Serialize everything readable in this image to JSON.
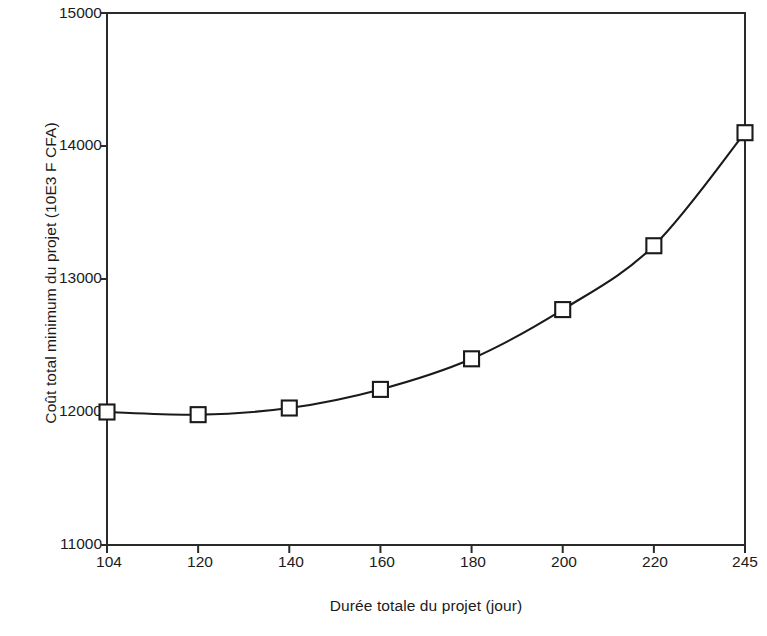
{
  "chart_data": {
    "type": "line",
    "title": "",
    "subtitle": "",
    "xlabel": "Durée totale du projet (jour)",
    "ylabel": "Coût total minimum du projet (10E3 F CFA)",
    "categories": [
      "104",
      "120",
      "140",
      "160",
      "180",
      "200",
      "220",
      "245"
    ],
    "x": [
      104,
      120,
      140,
      160,
      180,
      200,
      220,
      245
    ],
    "values": [
      12000,
      11980,
      12030,
      12170,
      12400,
      12770,
      13250,
      14100
    ],
    "series": [
      {
        "name": "Coût total minimum du projet",
        "values": [
          12000,
          11980,
          12030,
          12170,
          12400,
          12770,
          13250,
          14100
        ]
      }
    ],
    "ylim": [
      11000,
      15000
    ],
    "yticks": [
      11000,
      12000,
      13000,
      14000,
      15000
    ],
    "ytick_labels": [
      "11000",
      "12000",
      "13000",
      "14000",
      "15000"
    ],
    "xtick_labels": [
      "104",
      "120",
      "140",
      "160",
      "180",
      "200",
      "220",
      "245"
    ],
    "x_axis_spacing": "categorical",
    "grid": false,
    "legend": false,
    "legend_position": "none",
    "marker": "open-square",
    "line_color": "#1a1a1a",
    "marker_fill": "#ffffff",
    "background_color": "#ffffff",
    "annotations": []
  },
  "axes": {
    "y_title": "Coût total minimum du projet (10E3 F CFA)",
    "x_title": "Durée totale du projet (jour)",
    "y_ticks": [
      {
        "label": "15000",
        "value": 15000
      },
      {
        "label": "14000",
        "value": 14000
      },
      {
        "label": "13000",
        "value": 13000
      },
      {
        "label": "12000",
        "value": 12000
      },
      {
        "label": "11000",
        "value": 11000
      }
    ],
    "x_ticks": [
      {
        "label": "104",
        "value": 104
      },
      {
        "label": "120",
        "value": 120
      },
      {
        "label": "140",
        "value": 140
      },
      {
        "label": "160",
        "value": 160
      },
      {
        "label": "180",
        "value": 180
      },
      {
        "label": "200",
        "value": 200
      },
      {
        "label": "220",
        "value": 220
      },
      {
        "label": "245",
        "value": 245
      }
    ]
  }
}
